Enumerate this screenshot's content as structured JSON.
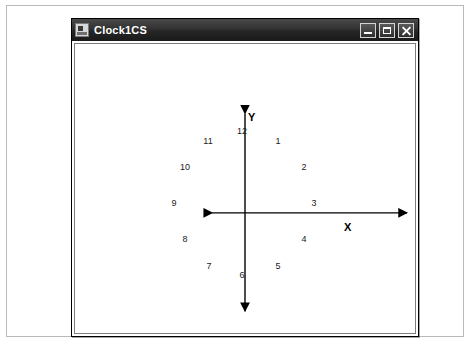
{
  "window": {
    "title": "Clock1CS",
    "icon": "application-icon",
    "buttons": [
      {
        "name": "minimize",
        "label": "Minimize",
        "glyph": "minimize-icon"
      },
      {
        "name": "maximize",
        "label": "Maximize",
        "glyph": "maximize-icon"
      },
      {
        "name": "close",
        "label": "Close",
        "glyph": "close-icon"
      }
    ]
  },
  "chart_data": {
    "type": "scatter",
    "title": "",
    "xlabel": "X",
    "ylabel": "Y",
    "grid": false,
    "legend": false,
    "axes": {
      "origin": {
        "x": 234,
        "y": 196
      },
      "x_axis": {
        "start_x": 134,
        "end_x": 341,
        "y": 196,
        "arrows": "both"
      },
      "y_axis": {
        "x": 234,
        "start_y": 92,
        "end_y": 299,
        "arrows": "both"
      },
      "radius": 72
    },
    "categories": [
      "12",
      "1",
      "2",
      "3",
      "4",
      "5",
      "6",
      "7",
      "8",
      "9",
      "10",
      "11"
    ],
    "points": [
      {
        "label": "12",
        "angle_deg": 90,
        "x": 0.0,
        "y": 1.0,
        "px": 234,
        "py": 124
      },
      {
        "label": "1",
        "angle_deg": 60,
        "x": 0.5,
        "y": 0.866,
        "px": 270,
        "py": 134
      },
      {
        "label": "2",
        "angle_deg": 30,
        "x": 0.866,
        "y": 0.5,
        "px": 296,
        "py": 160
      },
      {
        "label": "3",
        "angle_deg": 0,
        "x": 1.0,
        "y": 0.0,
        "px": 306,
        "py": 196
      },
      {
        "label": "4",
        "angle_deg": -30,
        "x": 0.866,
        "y": -0.5,
        "px": 296,
        "py": 232
      },
      {
        "label": "5",
        "angle_deg": -60,
        "x": 0.5,
        "y": -0.866,
        "px": 270,
        "py": 259
      },
      {
        "label": "6",
        "angle_deg": -90,
        "x": 0.0,
        "y": -1.0,
        "px": 234,
        "py": 268
      },
      {
        "label": "7",
        "angle_deg": -120,
        "x": -0.5,
        "y": -0.866,
        "px": 201,
        "py": 259
      },
      {
        "label": "8",
        "angle_deg": -150,
        "x": -0.866,
        "y": -0.5,
        "px": 177,
        "py": 232
      },
      {
        "label": "9",
        "angle_deg": 180,
        "x": -1.0,
        "y": 0.0,
        "px": 166,
        "py": 196
      },
      {
        "label": "10",
        "angle_deg": 150,
        "x": -0.866,
        "y": 0.5,
        "px": 177,
        "py": 160
      },
      {
        "label": "11",
        "angle_deg": 120,
        "x": -0.5,
        "y": 0.866,
        "px": 200,
        "py": 134
      }
    ]
  }
}
